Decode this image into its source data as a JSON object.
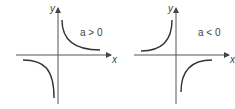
{
  "figures": [
    {
      "id": "positive",
      "condition_label": "a > 0",
      "x_axis_label": "x",
      "y_axis_label": "y",
      "curve_quadrants": [
        "I",
        "III"
      ]
    },
    {
      "id": "negative",
      "condition_label": "a < 0",
      "x_axis_label": "x",
      "y_axis_label": "y",
      "curve_quadrants": [
        "II",
        "IV"
      ]
    }
  ],
  "colors": {
    "stroke": "#333333",
    "text": "#444444"
  }
}
